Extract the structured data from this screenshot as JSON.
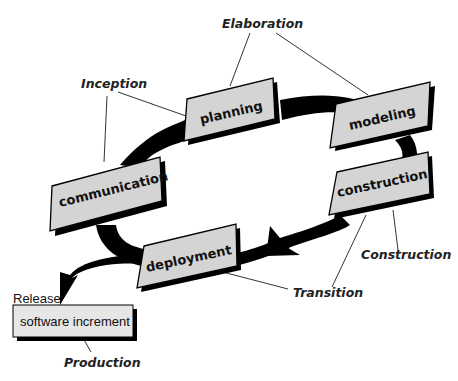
{
  "diagram": {
    "type": "unified-process-cycle",
    "activities": [
      {
        "id": "communication",
        "label": "communication"
      },
      {
        "id": "planning",
        "label": "planning"
      },
      {
        "id": "modeling",
        "label": "modeling"
      },
      {
        "id": "construction",
        "label": "construction"
      },
      {
        "id": "deployment",
        "label": "deployment"
      }
    ],
    "phases": [
      {
        "id": "inception",
        "label": "Inception",
        "connects": [
          "communication",
          "planning"
        ]
      },
      {
        "id": "elaboration",
        "label": "Elaboration",
        "connects": [
          "planning",
          "modeling"
        ]
      },
      {
        "id": "construction",
        "label": "Construction",
        "connects": [
          "construction"
        ]
      },
      {
        "id": "transition",
        "label": "Transition",
        "connects": [
          "construction",
          "deployment"
        ]
      },
      {
        "id": "production",
        "label": "Production",
        "connects": [
          "software-increment"
        ]
      }
    ],
    "release": {
      "label": "Release",
      "box_label": "software increment"
    },
    "colors": {
      "box_fill": "#d4d4d4",
      "box_shadow": "#000000",
      "arrow": "#000000",
      "increment_fill": "#e6e6e6"
    }
  }
}
